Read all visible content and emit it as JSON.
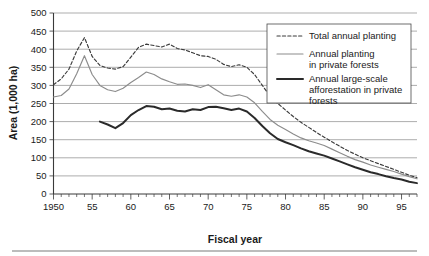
{
  "chart_data": {
    "type": "line",
    "title": "",
    "xlabel": "Fiscal year",
    "ylabel": "Area (1,000 ha)",
    "xlim": [
      1950,
      1997
    ],
    "ylim": [
      0,
      500
    ],
    "yticks": [
      0,
      50,
      100,
      150,
      200,
      250,
      300,
      350,
      400,
      450,
      500
    ],
    "ytick_labels": [
      "0",
      "50",
      "100",
      "150",
      "200",
      "250",
      "300",
      "350",
      "400",
      "450",
      "500"
    ],
    "xticks": [
      1950,
      1955,
      1960,
      1965,
      1970,
      1975,
      1980,
      1985,
      1990,
      1995
    ],
    "xtick_labels": [
      "1950",
      "55",
      "60",
      "65",
      "70",
      "75",
      "80",
      "85",
      "90",
      "95"
    ],
    "grid": "horizontal",
    "legend_position": "top-right",
    "series": [
      {
        "name": "Total annual planting",
        "style": "dashed",
        "color": "#3b3b3b",
        "x": [
          1950,
          1951,
          1952,
          1953,
          1954,
          1955,
          1956,
          1957,
          1958,
          1959,
          1960,
          1961,
          1962,
          1963,
          1964,
          1965,
          1966,
          1967,
          1968,
          1969,
          1970,
          1971,
          1972,
          1973,
          1974,
          1975,
          1976,
          1977,
          1978,
          1979,
          1980,
          1981,
          1982,
          1983,
          1984,
          1985,
          1986,
          1987,
          1988,
          1989,
          1990,
          1991,
          1992,
          1993,
          1994,
          1995,
          1996,
          1997
        ],
        "values": [
          302,
          318,
          345,
          395,
          432,
          380,
          355,
          348,
          345,
          352,
          378,
          405,
          414,
          410,
          406,
          414,
          402,
          398,
          390,
          382,
          380,
          372,
          358,
          352,
          357,
          350,
          330,
          300,
          270,
          250,
          232,
          214,
          198,
          184,
          170,
          157,
          144,
          132,
          120,
          110,
          100,
          92,
          84,
          76,
          68,
          60,
          52,
          45
        ]
      },
      {
        "name": "Annual planting in private forests",
        "style": "solid",
        "color": "#8c8c8c",
        "x": [
          1950,
          1951,
          1952,
          1953,
          1954,
          1955,
          1956,
          1957,
          1958,
          1959,
          1960,
          1961,
          1962,
          1963,
          1964,
          1965,
          1966,
          1967,
          1968,
          1969,
          1970,
          1971,
          1972,
          1973,
          1974,
          1975,
          1976,
          1977,
          1978,
          1979,
          1980,
          1981,
          1982,
          1983,
          1984,
          1985,
          1986,
          1987,
          1988,
          1989,
          1990,
          1991,
          1992,
          1993,
          1994,
          1995,
          1996,
          1997
        ],
        "values": [
          268,
          272,
          290,
          332,
          382,
          330,
          300,
          288,
          283,
          292,
          308,
          322,
          337,
          330,
          318,
          310,
          303,
          304,
          300,
          294,
          302,
          288,
          274,
          270,
          274,
          268,
          252,
          228,
          206,
          190,
          178,
          166,
          155,
          147,
          141,
          134,
          124,
          114,
          104,
          95,
          88,
          80,
          74,
          68,
          62,
          55,
          48,
          42
        ]
      },
      {
        "name": "Annual large-scale afforestation in private forests",
        "style": "solid-bold",
        "color": "#2a2a2a",
        "x": [
          1956,
          1957,
          1958,
          1959,
          1960,
          1961,
          1962,
          1963,
          1964,
          1965,
          1966,
          1967,
          1968,
          1969,
          1970,
          1971,
          1972,
          1973,
          1974,
          1975,
          1976,
          1977,
          1978,
          1979,
          1980,
          1981,
          1982,
          1983,
          1984,
          1985,
          1986,
          1987,
          1988,
          1989,
          1990,
          1991,
          1992,
          1993,
          1994,
          1995,
          1996,
          1997
        ],
        "values": [
          200,
          192,
          182,
          196,
          218,
          232,
          243,
          241,
          234,
          236,
          230,
          228,
          234,
          232,
          240,
          241,
          237,
          232,
          236,
          228,
          210,
          188,
          168,
          152,
          143,
          135,
          126,
          118,
          112,
          106,
          98,
          90,
          82,
          74,
          67,
          60,
          55,
          49,
          44,
          40,
          34,
          30
        ]
      }
    ]
  },
  "axes": {
    "y_title": "Area (1,000 ha)",
    "x_title": "Fiscal year"
  },
  "legend": {
    "items": [
      {
        "label_line1": "Total annual planting",
        "label_line2": "",
        "label_line3": "",
        "style": "dashed"
      },
      {
        "label_line1": "Annual planting",
        "label_line2": "in private forests",
        "label_line3": "",
        "style": "solid"
      },
      {
        "label_line1": "Annual large-scale",
        "label_line2": "afforestation in private",
        "label_line3": "forests",
        "style": "solid-bold"
      }
    ]
  },
  "colors": {
    "total_annual_planting": "#3b3b3b",
    "annual_planting_private": "#8c8c8c",
    "large_scale_afforestation": "#2a2a2a",
    "gridline": "#8a8a8a",
    "axis": "#3a3a3a",
    "background": "#ffffff"
  }
}
